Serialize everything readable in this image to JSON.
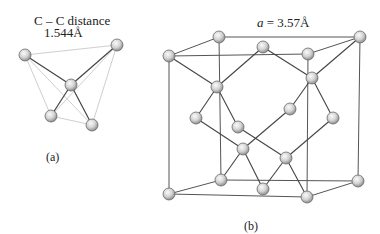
{
  "figure_a": {
    "caption": "(a)",
    "title_line1": "C – C distance",
    "title_line2": "1.544Å",
    "atoms": [
      {
        "id": "a1",
        "x": 25,
        "y": 55
      },
      {
        "id": "a2",
        "x": 117,
        "y": 45
      },
      {
        "id": "center",
        "x": 71,
        "y": 85
      },
      {
        "id": "a3",
        "x": 51,
        "y": 116
      },
      {
        "id": "a4",
        "x": 92,
        "y": 125
      }
    ]
  },
  "figure_b": {
    "caption": "(b)",
    "lattice_label_var": "a",
    "lattice_label_value": " = 3.57Å",
    "atoms_count": 18
  },
  "colors": {
    "line": "#555555",
    "light_line": "#c8c8c8",
    "atom_fill_light": "#f2f2f2",
    "atom_fill_dark": "#9a9a9a",
    "atom_stroke": "#6a6a6a"
  }
}
